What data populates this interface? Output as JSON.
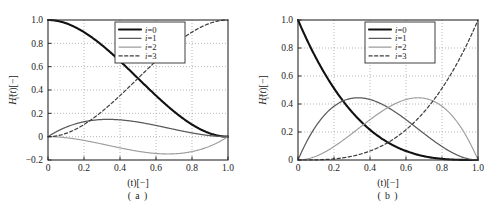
{
  "figure": {
    "panels": [
      {
        "id": "a",
        "caption": "( a )",
        "ylabel_main": "H",
        "ylabel_sub": "i",
        "ylabel_sup": "3",
        "ylabel_arg": "(t)[−]",
        "xlabel": "(t)[−]",
        "xticks": [
          "0",
          "0.2",
          "0.4",
          "0.6",
          "0.8",
          "1.0"
        ],
        "xtick_values": [
          0,
          0.2,
          0.4,
          0.6,
          0.8,
          1.0
        ],
        "yticks": [
          "−0.2",
          "0",
          "0.2",
          "0.4",
          "0.6",
          "0.8",
          "1.0"
        ],
        "ytick_values": [
          -0.2,
          0,
          0.2,
          0.4,
          0.6,
          0.8,
          1.0
        ],
        "legend": [
          {
            "label": "i=0",
            "style": "solid-thick-black"
          },
          {
            "label": "i=1",
            "style": "solid-gray"
          },
          {
            "label": "i=2",
            "style": "solid-lightgray"
          },
          {
            "label": "i=3",
            "style": "dashed-dark"
          }
        ]
      },
      {
        "id": "b",
        "caption": "( b )",
        "ylabel_main": "H",
        "ylabel_sub": "i",
        "ylabel_sup": "3",
        "ylabel_arg": "(t)[−]",
        "xlabel": "(t)[−]",
        "xticks": [
          "0",
          "0.2",
          "0.4",
          "0.6",
          "0.8",
          "1.0"
        ],
        "xtick_values": [
          0,
          0.2,
          0.4,
          0.6,
          0.8,
          1.0
        ],
        "yticks": [
          "0",
          "0.2",
          "0.4",
          "0.6",
          "0.8",
          "1.0"
        ],
        "ytick_values": [
          0,
          0.2,
          0.4,
          0.6,
          0.8,
          1.0
        ],
        "legend": [
          {
            "label": "i=0",
            "style": "solid-thick-black"
          },
          {
            "label": "i=1",
            "style": "solid-gray"
          },
          {
            "label": "i=2",
            "style": "solid-lightgray"
          },
          {
            "label": "i=3",
            "style": "dashed-dark"
          }
        ]
      }
    ]
  },
  "chart_data": [
    {
      "type": "line",
      "panel": "a",
      "title": "",
      "subtitle": "( a )",
      "xlabel": "(t)[−]",
      "ylabel": "H_i^3(t)[−]",
      "xlim": [
        0.0,
        1.0
      ],
      "ylim": [
        -0.2,
        1.0
      ],
      "grid": true,
      "legend_position": "top-center",
      "x": [
        0.0,
        0.05,
        0.1,
        0.15,
        0.2,
        0.25,
        0.3,
        0.35,
        0.4,
        0.45,
        0.5,
        0.55,
        0.6,
        0.65,
        0.7,
        0.75,
        0.8,
        0.85,
        0.9,
        0.95,
        1.0
      ],
      "series": [
        {
          "name": "i=0",
          "formula": "2t^3 - 3t^2 + 1",
          "values": [
            1.0,
            0.9928,
            0.972,
            0.9393,
            0.896,
            0.8438,
            0.784,
            0.7183,
            0.648,
            0.5748,
            0.5,
            0.4253,
            0.352,
            0.2818,
            0.216,
            0.1563,
            0.104,
            0.0608,
            0.028,
            0.0073,
            0.0
          ]
        },
        {
          "name": "i=1",
          "formula": "t^3 - 2t^2 + t",
          "values": [
            0.0,
            0.0451,
            0.081,
            0.1084,
            0.128,
            0.1406,
            0.147,
            0.1479,
            0.144,
            0.1361,
            0.125,
            0.1114,
            0.096,
            0.0796,
            0.063,
            0.0469,
            0.032,
            0.0191,
            0.009,
            0.0024,
            0.0
          ]
        },
        {
          "name": "i=2",
          "formula": "t^3 - t^2",
          "values": [
            0.0,
            -0.0024,
            -0.009,
            -0.0191,
            -0.032,
            -0.0469,
            -0.063,
            -0.0796,
            -0.096,
            -0.1114,
            -0.125,
            -0.1361,
            -0.144,
            -0.1479,
            -0.147,
            -0.1406,
            -0.128,
            -0.1084,
            -0.081,
            -0.0451,
            0.0
          ]
        },
        {
          "name": "i=3",
          "formula": "-2t^3 + 3t^2",
          "values": [
            0.0,
            0.0073,
            0.028,
            0.0608,
            0.104,
            0.1563,
            0.216,
            0.2818,
            0.352,
            0.4253,
            0.5,
            0.5748,
            0.648,
            0.7183,
            0.784,
            0.8438,
            0.896,
            0.9393,
            0.972,
            0.9928,
            1.0
          ]
        }
      ]
    },
    {
      "type": "line",
      "panel": "b",
      "title": "",
      "subtitle": "( b )",
      "xlabel": "(t)[−]",
      "ylabel": "H_i^3(t)[−]",
      "xlim": [
        0.0,
        1.0
      ],
      "ylim": [
        0.0,
        1.0
      ],
      "grid": true,
      "legend_position": "top-center",
      "x": [
        0.0,
        0.05,
        0.1,
        0.15,
        0.2,
        0.25,
        0.3,
        0.35,
        0.4,
        0.45,
        0.5,
        0.55,
        0.6,
        0.65,
        0.7,
        0.75,
        0.8,
        0.85,
        0.9,
        0.95,
        1.0
      ],
      "series": [
        {
          "name": "i=0",
          "formula": "(1-t)^3",
          "values": [
            1.0,
            0.8574,
            0.729,
            0.6141,
            0.512,
            0.4219,
            0.343,
            0.2746,
            0.216,
            0.1664,
            0.125,
            0.0911,
            0.064,
            0.0429,
            0.027,
            0.0156,
            0.008,
            0.0034,
            0.001,
            0.0001,
            0.0
          ]
        },
        {
          "name": "i=1",
          "formula": "3t(1-t)^2",
          "values": [
            0.0,
            0.1354,
            0.243,
            0.3251,
            0.384,
            0.4219,
            0.441,
            0.4436,
            0.432,
            0.4084,
            0.375,
            0.3341,
            0.288,
            0.2389,
            0.189,
            0.1406,
            0.096,
            0.0574,
            0.027,
            0.0071,
            0.0
          ]
        },
        {
          "name": "i=2",
          "formula": "3t^2(1-t)",
          "values": [
            0.0,
            0.0071,
            0.027,
            0.0574,
            0.096,
            0.1406,
            0.189,
            0.2389,
            0.288,
            0.3341,
            0.375,
            0.4084,
            0.432,
            0.4436,
            0.441,
            0.4219,
            0.384,
            0.3251,
            0.243,
            0.1354,
            0.0
          ]
        },
        {
          "name": "i=3",
          "formula": "t^3",
          "values": [
            0.0,
            0.0001,
            0.001,
            0.0034,
            0.008,
            0.0156,
            0.027,
            0.0429,
            0.064,
            0.0911,
            0.125,
            0.1664,
            0.216,
            0.2746,
            0.343,
            0.4219,
            0.512,
            0.6141,
            0.729,
            0.8574,
            1.0
          ]
        }
      ]
    }
  ]
}
